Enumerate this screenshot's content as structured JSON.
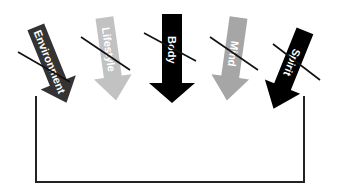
{
  "diagram": {
    "arrows": [
      {
        "id": "environment",
        "label": "Environment",
        "color": "#333333",
        "crossed_out": true
      },
      {
        "id": "lifestyle",
        "label": "Lifestyle",
        "color": "#c2c2c2",
        "crossed_out": true
      },
      {
        "id": "body",
        "label": "Body",
        "color": "#000000",
        "crossed_out": true
      },
      {
        "id": "mind",
        "label": "Mind",
        "color": "#a6a6a6",
        "crossed_out": true
      },
      {
        "id": "spirit",
        "label": "Spirit",
        "color": "#000000",
        "crossed_out": true
      }
    ],
    "container": {
      "shape": "open-top bracket",
      "color": "#222222"
    }
  }
}
